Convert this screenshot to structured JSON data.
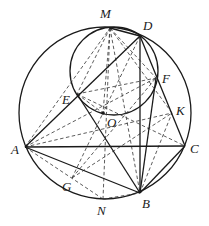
{
  "figure": {
    "type": "geometry-diagram",
    "big_circle": {
      "cx": 105,
      "cy": 113,
      "r": 86
    },
    "small_circle": {
      "cx": 114,
      "cy": 71,
      "r": 44
    },
    "points": {
      "M": {
        "label": "M",
        "x": 110,
        "y": 28,
        "lx": 100,
        "ly": 18
      },
      "D": {
        "label": "D",
        "x": 140,
        "y": 36,
        "lx": 143,
        "ly": 30
      },
      "E": {
        "label": "E",
        "x": 77,
        "y": 94,
        "lx": 62,
        "ly": 104
      },
      "F": {
        "label": "F",
        "x": 156,
        "y": 78,
        "lx": 162,
        "ly": 83
      },
      "O": {
        "label": "O",
        "x": 103,
        "y": 113,
        "lx": 107,
        "ly": 127
      },
      "K": {
        "label": "K",
        "x": 172,
        "y": 113,
        "lx": 176,
        "ly": 115
      },
      "A": {
        "label": "A",
        "x": 25,
        "y": 147,
        "lx": 11,
        "ly": 154
      },
      "C": {
        "label": "C",
        "x": 185,
        "y": 146,
        "lx": 190,
        "ly": 153
      },
      "G": {
        "label": "G",
        "x": 72,
        "y": 178,
        "lx": 62,
        "ly": 191
      },
      "N": {
        "label": "N",
        "x": 103,
        "y": 199,
        "lx": 97,
        "ly": 215
      },
      "B": {
        "label": "B",
        "x": 140,
        "y": 193,
        "lx": 142,
        "ly": 208
      }
    },
    "solid_segments": [
      [
        "A",
        "C"
      ],
      [
        "A",
        "B"
      ],
      [
        "B",
        "C"
      ],
      [
        "A",
        "D"
      ],
      [
        "D",
        "B"
      ],
      [
        "D",
        "C"
      ],
      [
        "E",
        "B"
      ],
      [
        "F",
        "B"
      ],
      [
        "M",
        "D"
      ]
    ],
    "dashed_segments": [
      [
        "M",
        "E"
      ],
      [
        "M",
        "O"
      ],
      [
        "M",
        "N"
      ],
      [
        "M",
        "F"
      ],
      [
        "M",
        "B"
      ],
      [
        "M",
        "K"
      ],
      [
        "A",
        "M"
      ],
      [
        "A",
        "K"
      ],
      [
        "E",
        "F"
      ],
      [
        "E",
        "O"
      ],
      [
        "G",
        "O"
      ],
      [
        "G",
        "K"
      ],
      [
        "G",
        "F"
      ],
      [
        "N",
        "A"
      ],
      [
        "N",
        "B"
      ],
      [
        "A",
        "F"
      ],
      [
        "D",
        "O"
      ],
      [
        "B",
        "K"
      ],
      [
        "E",
        "C"
      ]
    ]
  }
}
